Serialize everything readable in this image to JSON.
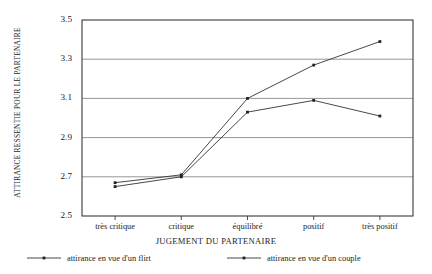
{
  "chart_data": {
    "type": "line",
    "title": "",
    "xlabel": "JUGEMENT DU PARTENAIRE",
    "ylabel": "ATTIRANCE RESSENTIE POUR LE PARTENAIRE",
    "categories": [
      "très critique",
      "critique",
      "équilibré",
      "positif",
      "très positif"
    ],
    "series": [
      {
        "name": "attirance en vue d'un flirt",
        "values": [
          2.67,
          2.71,
          3.1,
          3.27,
          3.39
        ],
        "color": "#333333"
      },
      {
        "name": "attirance en vue d'un couple",
        "values": [
          2.65,
          2.7,
          3.03,
          3.09,
          3.01
        ],
        "color": "#333333"
      }
    ],
    "ylim": [
      2.5,
      3.5
    ],
    "yticks": [
      2.5,
      2.7,
      2.9,
      3.1,
      3.3,
      3.5
    ],
    "ytick_labels": [
      "2.5",
      "2.7",
      "2.9",
      "3.1",
      "3.3",
      "3.5"
    ],
    "grid": true,
    "grid_axis": "y",
    "legend_position": "bottom",
    "marker": "dot",
    "colors": {
      "grid": "#8a8a8a",
      "axis": "#3a3a3a",
      "line": "#333333",
      "text": "#1c1c1c",
      "background": "#ffffff"
    }
  }
}
